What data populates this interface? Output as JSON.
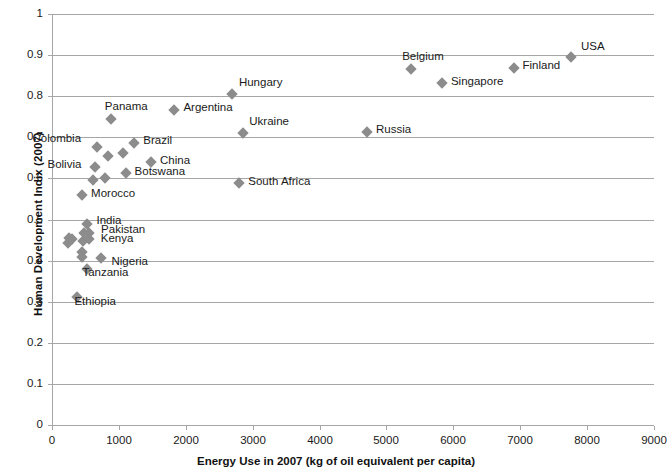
{
  "chart_data": {
    "type": "scatter",
    "title": "",
    "xlabel": "Energy Use in 2007 (kg of oil equivalent per capita)",
    "ylabel": "Human Development Indix (2007)",
    "xlim": [
      0,
      9000
    ],
    "ylim": [
      0,
      1
    ],
    "xticks": [
      "0",
      "1000",
      "2000",
      "3000",
      "4000",
      "5000",
      "6000",
      "7000",
      "8000",
      "9000"
    ],
    "xtick_values": [
      0,
      1000,
      2000,
      3000,
      4000,
      5000,
      6000,
      7000,
      8000,
      9000
    ],
    "yticks": [
      "0",
      "0.1",
      "0.2",
      "0.3",
      "0.4",
      "0.5",
      "0.6",
      "0.7",
      "0.8",
      "0.9",
      "1"
    ],
    "ytick_values": [
      0,
      0.1,
      0.2,
      0.3,
      0.4,
      0.5,
      0.6,
      0.7,
      0.8,
      0.9,
      1
    ],
    "grid": "horizontal",
    "legend": "none",
    "marker_color": "#8c8c8c",
    "grid_color": "#a6a6a6",
    "points": [
      {
        "label": "USA",
        "x": 7760,
        "y": 0.895,
        "lx": 10,
        "ly": -13
      },
      {
        "label": "Finland",
        "x": 6900,
        "y": 0.868,
        "lx": 9,
        "ly": -5
      },
      {
        "label": "Belgium",
        "x": 5370,
        "y": 0.866,
        "lx": -9,
        "ly": -15
      },
      {
        "label": "Singapore",
        "x": 5830,
        "y": 0.833,
        "lx": 9,
        "ly": -4
      },
      {
        "label": "Hungary",
        "x": 2690,
        "y": 0.805,
        "lx": 7,
        "ly": -14
      },
      {
        "label": "Argentina",
        "x": 1830,
        "y": 0.766,
        "lx": 9,
        "ly": -5
      },
      {
        "label": "Panama",
        "x": 880,
        "y": 0.744,
        "lx": -6,
        "ly": -15
      },
      {
        "label": "Ukraine",
        "x": 2860,
        "y": 0.71,
        "lx": 6,
        "ly": -14
      },
      {
        "label": "Russia",
        "x": 4710,
        "y": 0.712,
        "lx": 9,
        "ly": -5
      },
      {
        "label": "Brazil",
        "x": 1230,
        "y": 0.685,
        "lx": 9,
        "ly": -5
      },
      {
        "label": "Colombia",
        "x": 680,
        "y": 0.677,
        "lx": -65,
        "ly": -11
      },
      {
        "label": "Bolivia",
        "x": 650,
        "y": 0.627,
        "lx": -48,
        "ly": -5
      },
      {
        "label": "China",
        "x": 1480,
        "y": 0.641,
        "lx": 9,
        "ly": -4
      },
      {
        "label": "Botswana",
        "x": 1100,
        "y": 0.613,
        "lx": 9,
        "ly": -4
      },
      {
        "label": "South Africa",
        "x": 2800,
        "y": 0.589,
        "lx": 9,
        "ly": -4
      },
      {
        "label": "Morocco",
        "x": 450,
        "y": 0.56,
        "lx": 9,
        "ly": -4
      },
      {
        "label": "India",
        "x": 530,
        "y": 0.49,
        "lx": 9,
        "ly": -6
      },
      {
        "label": "Pakistan",
        "x": 555,
        "y": 0.466,
        "lx": 12,
        "ly": -6
      },
      {
        "label": "Kenya",
        "x": 550,
        "y": 0.452,
        "lx": 12,
        "ly": -3
      },
      {
        "label": "Nigeria",
        "x": 740,
        "y": 0.407,
        "lx": 10,
        "ly": 1
      },
      {
        "label": "Tanzania",
        "x": 530,
        "y": 0.38,
        "lx": -5,
        "ly": 1
      },
      {
        "label": "Ethiopia",
        "x": 380,
        "y": 0.312,
        "lx": -3,
        "ly": 2
      }
    ],
    "unlabeled_points": [
      {
        "x": 840,
        "y": 0.655
      },
      {
        "x": 1060,
        "y": 0.662
      },
      {
        "x": 790,
        "y": 0.6
      },
      {
        "x": 620,
        "y": 0.597
      },
      {
        "x": 300,
        "y": 0.452
      },
      {
        "x": 480,
        "y": 0.468
      },
      {
        "x": 470,
        "y": 0.448
      },
      {
        "x": 450,
        "y": 0.422
      },
      {
        "x": 450,
        "y": 0.408
      },
      {
        "x": 250,
        "y": 0.455
      },
      {
        "x": 240,
        "y": 0.443
      }
    ]
  }
}
